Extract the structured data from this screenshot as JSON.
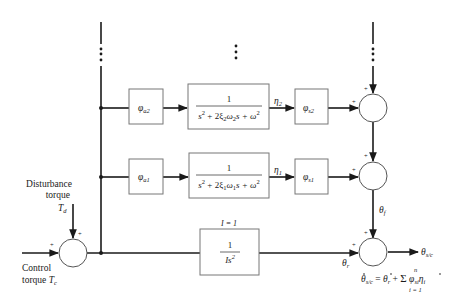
{
  "diagram": {
    "type": "block-diagram",
    "inputs": {
      "disturbance": {
        "line1": "Disturbance",
        "line2": "torque",
        "symbol": "T",
        "sub": "d"
      },
      "control": {
        "line1": "Control",
        "line2": "torque",
        "symbol": "T",
        "sub": "c"
      }
    },
    "signs": {
      "plus": "+"
    },
    "rows": [
      {
        "id": "mode2",
        "gain_in": {
          "symbol": "φ",
          "sub": "a2"
        },
        "tf": {
          "num": "1",
          "den_a": "s",
          "den_b": "+ 2ξ",
          "den_c": "ω",
          "den_d": "s + ω",
          "idx": "2"
        },
        "signal": {
          "symbol": "η",
          "sub": "2"
        },
        "gain_out": {
          "symbol": "φ",
          "sub": "s2"
        }
      },
      {
        "id": "mode1",
        "gain_in": {
          "symbol": "φ",
          "sub": "a1"
        },
        "tf": {
          "num": "1",
          "den_a": "s",
          "den_b": "+ 2ξ",
          "den_c": "ω",
          "den_d": "s + ω",
          "idx": "1"
        },
        "signal": {
          "symbol": "η",
          "sub": "1"
        },
        "gain_out": {
          "symbol": "φ",
          "sub": "s1"
        }
      }
    ],
    "rigid": {
      "param_label": "I = 1",
      "tf": {
        "num": "1",
        "den": "Is",
        "den_sup": "2"
      },
      "signal": {
        "symbol": "θ",
        "sub": "r"
      }
    },
    "flex_signal": {
      "symbol": "θ",
      "sub": "f"
    },
    "output": {
      "symbol": "θ",
      "sub": "s/c"
    },
    "equation": {
      "lhs": "θ",
      "lhs_sub": "s/c",
      "eq": "=",
      "t1": "θ",
      "t1_sub": "r",
      "plus": "+",
      "sum": "Σ",
      "sum_top": "n",
      "sum_bottom": "i = 1",
      "t2": "φ",
      "t2_sub": "si",
      "t3": "η",
      "t3_sub": "i"
    },
    "continuation": "⋮"
  }
}
